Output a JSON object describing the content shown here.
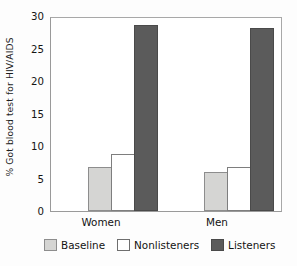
{
  "chart_data": {
    "type": "bar",
    "title": "",
    "xlabel": "",
    "ylabel": "% Got blood test for HIV/AIDS",
    "ylim": [
      0,
      30
    ],
    "yticks": [
      0,
      5,
      10,
      15,
      20,
      25,
      30
    ],
    "ytick_labels": [
      "0",
      "5",
      "10",
      "15",
      "20",
      "25",
      "30"
    ],
    "grid": false,
    "legend_position": "bottom",
    "categories": [
      "Women",
      "Men"
    ],
    "series": [
      {
        "name": "Baseline",
        "color": "#d5d5d3",
        "values": [
          6.8,
          6.0
        ]
      },
      {
        "name": "Nonlisteners",
        "color": "#ffffff",
        "values": [
          8.8,
          6.8
        ]
      },
      {
        "name": "Listeners",
        "color": "#5b5b5b",
        "values": [
          28.6,
          28.1
        ]
      }
    ]
  },
  "legend": {
    "items": [
      {
        "label": "Baseline",
        "swatch": "baseline"
      },
      {
        "label": "Nonlisteners",
        "swatch": "nonlisteners"
      },
      {
        "label": "Listeners",
        "swatch": "listeners"
      }
    ]
  }
}
